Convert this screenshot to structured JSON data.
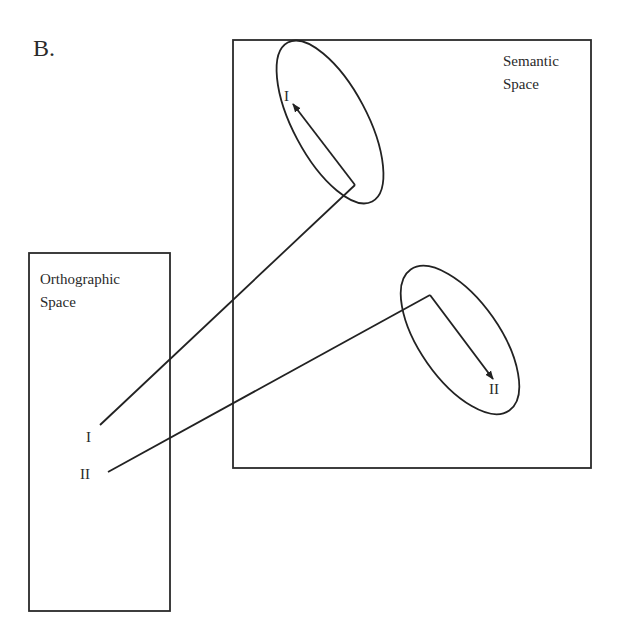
{
  "figure": {
    "panel_label": "B.",
    "semantic_space": {
      "title_line1": "Semantic",
      "title_line2": "Space",
      "box": {
        "x": 233,
        "y": 40,
        "w": 358,
        "h": 428
      },
      "clusters": [
        {
          "label": "I",
          "ellipse": {
            "cx": 330,
            "cy": 120,
            "rx": 38,
            "ry": 90,
            "rotate": -30
          },
          "arrow_from": [
            355,
            185
          ],
          "arrow_to": [
            293,
            103
          ],
          "label_pos": [
            284,
            88
          ]
        },
        {
          "label": "II",
          "ellipse": {
            "cx": 460,
            "cy": 340,
            "rx": 42,
            "ry": 85,
            "rotate": -35
          },
          "arrow_from": [
            430,
            295
          ],
          "arrow_to": [
            493,
            380
          ],
          "label_pos": [
            490,
            381
          ]
        }
      ]
    },
    "orthographic_space": {
      "title_line1": "Orthographic",
      "title_line2": "Space",
      "box": {
        "x": 30,
        "y": 253,
        "w": 140,
        "h": 358
      },
      "items": [
        {
          "label": "I",
          "label_pos": [
            86,
            428
          ],
          "line_start": [
            100,
            425
          ],
          "connects_to": [
            355,
            185
          ]
        },
        {
          "label": "II",
          "label_pos": [
            81,
            465
          ],
          "line_start": [
            108,
            472
          ],
          "connects_to": [
            430,
            295
          ]
        }
      ]
    },
    "stroke_color": "#222222",
    "background": "#ffffff"
  }
}
